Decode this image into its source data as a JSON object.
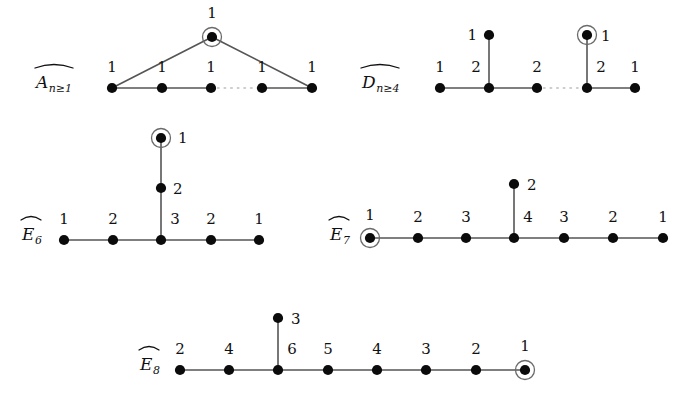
{
  "figure": {
    "background_color": "#ffffff",
    "node_color": "#0b0b0b",
    "edge_color": "#555555",
    "dotted_edge_color": "#bdbdbd",
    "ring_color": "#6a6a6a",
    "width": 682,
    "height": 397
  },
  "diagrams": [
    {
      "id": "A",
      "label_base": "A",
      "label_sub": "n≥1",
      "label_hat": "̂",
      "label_x": 36,
      "label_y": 88,
      "nodes": [
        {
          "name": "a0",
          "x": 212,
          "y": 37,
          "mark": "1",
          "mark_x": 212,
          "mark_y": 18,
          "mark_anchor": "middle",
          "circled": true
        },
        {
          "name": "a1",
          "x": 112,
          "y": 88,
          "mark": "1",
          "mark_x": 112,
          "mark_y": 72,
          "mark_anchor": "middle",
          "circled": false
        },
        {
          "name": "a2",
          "x": 162,
          "y": 88,
          "mark": "1",
          "mark_x": 162,
          "mark_y": 72,
          "mark_anchor": "middle",
          "circled": false
        },
        {
          "name": "a3",
          "x": 211,
          "y": 88,
          "mark": "1",
          "mark_x": 211,
          "mark_y": 72,
          "mark_anchor": "middle",
          "circled": false
        },
        {
          "name": "a4",
          "x": 262,
          "y": 88,
          "mark": "1",
          "mark_x": 262,
          "mark_y": 72,
          "mark_anchor": "middle",
          "circled": false
        },
        {
          "name": "a5",
          "x": 312,
          "y": 88,
          "mark": "1",
          "mark_x": 312,
          "mark_y": 72,
          "mark_anchor": "middle",
          "circled": false
        }
      ],
      "edges": [
        {
          "from": "a1",
          "to": "a2",
          "style": "solid"
        },
        {
          "from": "a2",
          "to": "a3",
          "style": "solid"
        },
        {
          "from": "a3",
          "to": "a4",
          "style": "dotted"
        },
        {
          "from": "a4",
          "to": "a5",
          "style": "solid"
        },
        {
          "from": "a1",
          "to": "a0",
          "style": "solid"
        },
        {
          "from": "a0",
          "to": "a5",
          "style": "solid"
        }
      ]
    },
    {
      "id": "D",
      "label_base": "D",
      "label_sub": "n≥4",
      "label_hat": "̂",
      "label_x": 362,
      "label_y": 88,
      "nodes": [
        {
          "name": "d_top_left",
          "x": 489,
          "y": 35,
          "mark": "1",
          "mark_x": 477,
          "mark_y": 40,
          "mark_anchor": "end",
          "circled": false
        },
        {
          "name": "d_top_right",
          "x": 587,
          "y": 35,
          "mark": "1",
          "mark_x": 601,
          "mark_y": 41,
          "mark_anchor": "start",
          "circled": true
        },
        {
          "name": "d1",
          "x": 440,
          "y": 88,
          "mark": "1",
          "mark_x": 440,
          "mark_y": 72,
          "mark_anchor": "middle",
          "circled": false
        },
        {
          "name": "d2",
          "x": 489,
          "y": 88,
          "mark": "2",
          "mark_x": 476,
          "mark_y": 72,
          "mark_anchor": "middle",
          "circled": false
        },
        {
          "name": "d3",
          "x": 537,
          "y": 88,
          "mark": "2",
          "mark_x": 537,
          "mark_y": 72,
          "mark_anchor": "middle",
          "circled": false
        },
        {
          "name": "d4",
          "x": 587,
          "y": 88,
          "mark": "2",
          "mark_x": 601,
          "mark_y": 72,
          "mark_anchor": "middle",
          "circled": false
        },
        {
          "name": "d5",
          "x": 635,
          "y": 88,
          "mark": "1",
          "mark_x": 635,
          "mark_y": 72,
          "mark_anchor": "middle",
          "circled": false
        }
      ],
      "edges": [
        {
          "from": "d1",
          "to": "d2",
          "style": "solid"
        },
        {
          "from": "d2",
          "to": "d3",
          "style": "solid"
        },
        {
          "from": "d3",
          "to": "d4",
          "style": "dotted"
        },
        {
          "from": "d4",
          "to": "d5",
          "style": "solid"
        },
        {
          "from": "d2",
          "to": "d_top_left",
          "style": "solid"
        },
        {
          "from": "d4",
          "to": "d_top_right",
          "style": "solid"
        }
      ]
    },
    {
      "id": "E6",
      "label_base": "E",
      "label_sub": "6",
      "label_hat": "̂",
      "label_x": 22,
      "label_y": 240,
      "nodes": [
        {
          "name": "e6_top",
          "x": 161,
          "y": 138,
          "mark": "1",
          "mark_x": 178,
          "mark_y": 143,
          "mark_anchor": "start",
          "circled": true
        },
        {
          "name": "e6_mid",
          "x": 161,
          "y": 188,
          "mark": "2",
          "mark_x": 173,
          "mark_y": 194,
          "mark_anchor": "start",
          "circled": false
        },
        {
          "name": "e6_1",
          "x": 64,
          "y": 240,
          "mark": "1",
          "mark_x": 64,
          "mark_y": 224,
          "mark_anchor": "middle",
          "circled": false
        },
        {
          "name": "e6_2",
          "x": 113,
          "y": 240,
          "mark": "2",
          "mark_x": 113,
          "mark_y": 224,
          "mark_anchor": "middle",
          "circled": false
        },
        {
          "name": "e6_3",
          "x": 161,
          "y": 240,
          "mark": "3",
          "mark_x": 175,
          "mark_y": 224,
          "mark_anchor": "middle",
          "circled": false
        },
        {
          "name": "e6_4",
          "x": 211,
          "y": 240,
          "mark": "2",
          "mark_x": 211,
          "mark_y": 224,
          "mark_anchor": "middle",
          "circled": false
        },
        {
          "name": "e6_5",
          "x": 259,
          "y": 240,
          "mark": "1",
          "mark_x": 259,
          "mark_y": 224,
          "mark_anchor": "middle",
          "circled": false
        }
      ],
      "edges": [
        {
          "from": "e6_1",
          "to": "e6_2",
          "style": "solid"
        },
        {
          "from": "e6_2",
          "to": "e6_3",
          "style": "solid"
        },
        {
          "from": "e6_3",
          "to": "e6_4",
          "style": "solid"
        },
        {
          "from": "e6_4",
          "to": "e6_5",
          "style": "solid"
        },
        {
          "from": "e6_3",
          "to": "e6_mid",
          "style": "solid"
        },
        {
          "from": "e6_mid",
          "to": "e6_top",
          "style": "solid"
        }
      ]
    },
    {
      "id": "E7",
      "label_base": "E",
      "label_sub": "7",
      "label_hat": "̂",
      "label_x": 330,
      "label_y": 240,
      "nodes": [
        {
          "name": "e7_top",
          "x": 514,
          "y": 184,
          "mark": "2",
          "mark_x": 527,
          "mark_y": 190,
          "mark_anchor": "start",
          "circled": false
        },
        {
          "name": "e7_0",
          "x": 370,
          "y": 238,
          "mark": "1",
          "mark_x": 370,
          "mark_y": 220,
          "mark_anchor": "middle",
          "circled": true
        },
        {
          "name": "e7_1",
          "x": 418,
          "y": 238,
          "mark": "2",
          "mark_x": 418,
          "mark_y": 222,
          "mark_anchor": "middle",
          "circled": false
        },
        {
          "name": "e7_2",
          "x": 466,
          "y": 238,
          "mark": "3",
          "mark_x": 466,
          "mark_y": 222,
          "mark_anchor": "middle",
          "circled": false
        },
        {
          "name": "e7_3",
          "x": 514,
          "y": 238,
          "mark": "4",
          "mark_x": 528,
          "mark_y": 222,
          "mark_anchor": "middle",
          "circled": false
        },
        {
          "name": "e7_4",
          "x": 564,
          "y": 238,
          "mark": "3",
          "mark_x": 564,
          "mark_y": 222,
          "mark_anchor": "middle",
          "circled": false
        },
        {
          "name": "e7_5",
          "x": 613,
          "y": 238,
          "mark": "2",
          "mark_x": 613,
          "mark_y": 222,
          "mark_anchor": "middle",
          "circled": false
        },
        {
          "name": "e7_6",
          "x": 663,
          "y": 238,
          "mark": "1",
          "mark_x": 663,
          "mark_y": 222,
          "mark_anchor": "middle",
          "circled": false
        }
      ],
      "edges": [
        {
          "from": "e7_0",
          "to": "e7_1",
          "style": "solid"
        },
        {
          "from": "e7_1",
          "to": "e7_2",
          "style": "solid"
        },
        {
          "from": "e7_2",
          "to": "e7_3",
          "style": "solid"
        },
        {
          "from": "e7_3",
          "to": "e7_4",
          "style": "solid"
        },
        {
          "from": "e7_4",
          "to": "e7_5",
          "style": "solid"
        },
        {
          "from": "e7_5",
          "to": "e7_6",
          "style": "solid"
        },
        {
          "from": "e7_3",
          "to": "e7_top",
          "style": "solid"
        }
      ]
    },
    {
      "id": "E8",
      "label_base": "E",
      "label_sub": "8",
      "label_hat": "̂",
      "label_x": 140,
      "label_y": 370,
      "nodes": [
        {
          "name": "e8_top",
          "x": 278,
          "y": 318,
          "mark": "3",
          "mark_x": 291,
          "mark_y": 324,
          "mark_anchor": "start",
          "circled": false
        },
        {
          "name": "e8_1",
          "x": 180,
          "y": 370,
          "mark": "2",
          "mark_x": 180,
          "mark_y": 354,
          "mark_anchor": "middle",
          "circled": false
        },
        {
          "name": "e8_2",
          "x": 229,
          "y": 370,
          "mark": "4",
          "mark_x": 229,
          "mark_y": 354,
          "mark_anchor": "middle",
          "circled": false
        },
        {
          "name": "e8_3",
          "x": 278,
          "y": 370,
          "mark": "6",
          "mark_x": 292,
          "mark_y": 354,
          "mark_anchor": "middle",
          "circled": false
        },
        {
          "name": "e8_4",
          "x": 328,
          "y": 370,
          "mark": "5",
          "mark_x": 328,
          "mark_y": 354,
          "mark_anchor": "middle",
          "circled": false
        },
        {
          "name": "e8_5",
          "x": 377,
          "y": 370,
          "mark": "4",
          "mark_x": 377,
          "mark_y": 354,
          "mark_anchor": "middle",
          "circled": false
        },
        {
          "name": "e8_6",
          "x": 426,
          "y": 370,
          "mark": "3",
          "mark_x": 426,
          "mark_y": 354,
          "mark_anchor": "middle",
          "circled": false
        },
        {
          "name": "e8_7",
          "x": 476,
          "y": 370,
          "mark": "2",
          "mark_x": 476,
          "mark_y": 354,
          "mark_anchor": "middle",
          "circled": false
        },
        {
          "name": "e8_0",
          "x": 525,
          "y": 370,
          "mark": "1",
          "mark_x": 525,
          "mark_y": 351,
          "mark_anchor": "middle",
          "circled": true
        }
      ],
      "edges": [
        {
          "from": "e8_1",
          "to": "e8_2",
          "style": "solid"
        },
        {
          "from": "e8_2",
          "to": "e8_3",
          "style": "solid"
        },
        {
          "from": "e8_3",
          "to": "e8_4",
          "style": "solid"
        },
        {
          "from": "e8_4",
          "to": "e8_5",
          "style": "solid"
        },
        {
          "from": "e8_5",
          "to": "e8_6",
          "style": "solid"
        },
        {
          "from": "e8_6",
          "to": "e8_7",
          "style": "solid"
        },
        {
          "from": "e8_7",
          "to": "e8_0",
          "style": "solid"
        },
        {
          "from": "e8_3",
          "to": "e8_top",
          "style": "solid"
        }
      ]
    }
  ]
}
